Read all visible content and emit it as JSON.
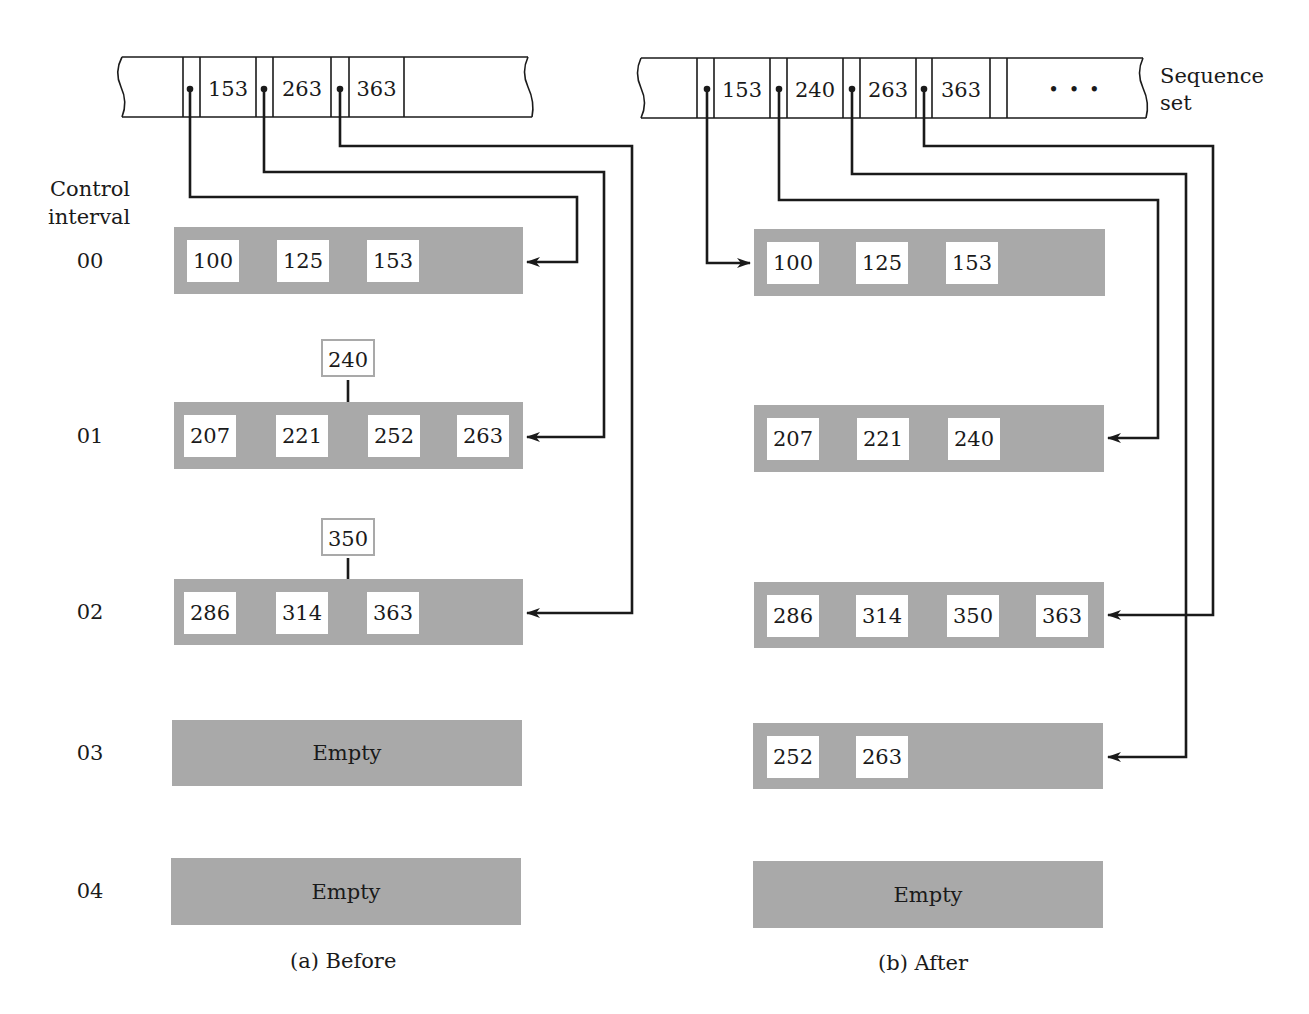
{
  "left_label": {
    "line1": "Control",
    "line2": "interval"
  },
  "sequence_set_label": {
    "line1": "Sequence",
    "line2": "set"
  },
  "ci_numbers": [
    "00",
    "01",
    "02",
    "03",
    "04"
  ],
  "before": {
    "caption": "(a)  Before",
    "sequence_set": [
      "153",
      "263",
      "363"
    ],
    "intervals": [
      {
        "id": "00",
        "records": [
          "100",
          "125",
          "153"
        ]
      },
      {
        "id": "01",
        "records": [
          "207",
          "221",
          "252",
          "263"
        ],
        "insert": "240"
      },
      {
        "id": "02",
        "records": [
          "286",
          "314",
          "363"
        ],
        "insert": "350"
      },
      {
        "id": "03",
        "records": [],
        "empty_label": "Empty"
      },
      {
        "id": "04",
        "records": [],
        "empty_label": "Empty"
      }
    ]
  },
  "after": {
    "caption": "(b)  After",
    "sequence_set": [
      "153",
      "240",
      "263",
      "363"
    ],
    "ellipsis": "• • •",
    "intervals": [
      {
        "id": "00",
        "records": [
          "100",
          "125",
          "153"
        ]
      },
      {
        "id": "01",
        "records": [
          "207",
          "221",
          "240"
        ]
      },
      {
        "id": "02",
        "records": [
          "286",
          "314",
          "350",
          "363"
        ]
      },
      {
        "id": "03",
        "records": [
          "252",
          "263"
        ]
      },
      {
        "id": "04",
        "records": [],
        "empty_label": "Empty"
      }
    ]
  },
  "colors": {
    "interval_fill": "#a9a9a9",
    "line": "#1a1a1a",
    "record_fill": "#ffffff"
  }
}
